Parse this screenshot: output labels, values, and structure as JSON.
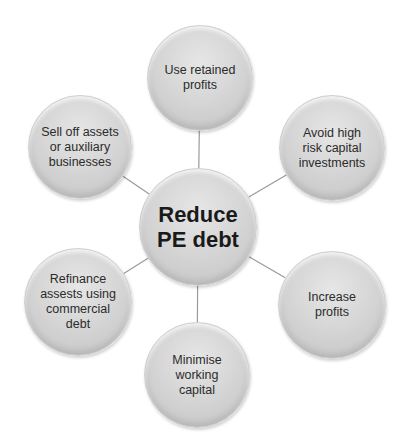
{
  "diagram": {
    "center": {
      "label": "Reduce\nPE debt",
      "cx": 198,
      "cy": 227,
      "r": 59
    },
    "nodes": [
      {
        "id": "top",
        "label": "Use retained\nprofits",
        "cx": 200,
        "cy": 78,
        "r": 53
      },
      {
        "id": "top-right",
        "label": "Avoid high\nrisk capital\ninvestments",
        "cx": 332,
        "cy": 148,
        "r": 53
      },
      {
        "id": "bottom-right",
        "label": "Increase\nprofits",
        "cx": 332,
        "cy": 305,
        "r": 54
      },
      {
        "id": "bottom",
        "label": "Minimise\nworking\ncapital",
        "cx": 197,
        "cy": 375,
        "r": 53
      },
      {
        "id": "bottom-left",
        "label": "Refinance\nassests using\ncommercial\ndebt",
        "cx": 78,
        "cy": 302,
        "r": 54
      },
      {
        "id": "top-left",
        "label": "Sell off assets\nor auxiliary\nbusinesses",
        "cx": 80,
        "cy": 147,
        "r": 52
      }
    ],
    "colors": {
      "connector": "#9a9a9a",
      "node_fill": "#d6d6d6",
      "text": "#2b2b2b"
    }
  }
}
